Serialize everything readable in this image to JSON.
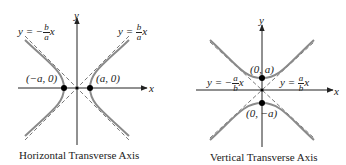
{
  "left": {
    "caption": "Horizontal Transverse Axis",
    "x_axis_label": "x",
    "y_axis_label": "y",
    "vertex_left": "(−a, 0)",
    "vertex_right": "(a, 0)",
    "asymptote_neg": {
      "prefix": "y = −",
      "num": "b",
      "den": "a",
      "suffix": "x"
    },
    "asymptote_pos": {
      "prefix": "y = ",
      "num": "b",
      "den": "a",
      "suffix": "x"
    }
  },
  "right": {
    "caption": "Vertical Transverse Axis",
    "x_axis_label": "x",
    "y_axis_label": "y",
    "vertex_top": "(0, a)",
    "vertex_bottom": "(0, −a)",
    "asymptote_neg": {
      "prefix": "y = −",
      "num": "a",
      "den": "b",
      "suffix": "x"
    },
    "asymptote_pos": {
      "prefix": "y = ",
      "num": "a",
      "den": "b",
      "suffix": "x"
    }
  },
  "colors": {
    "curve": "#8a8a8a",
    "axis": "#222222",
    "asymptote": "#555555",
    "point": "#000000"
  }
}
